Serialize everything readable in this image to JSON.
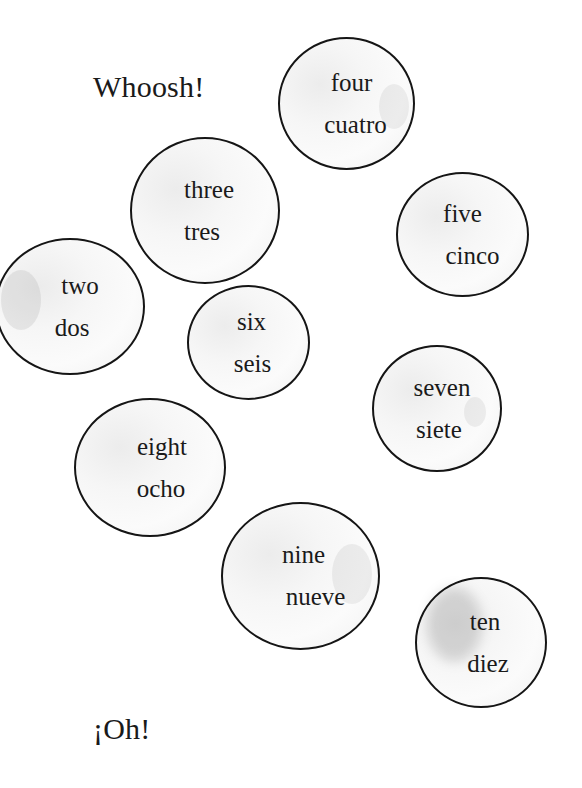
{
  "page": {
    "background": "#ffffff",
    "ink_color": "#151515"
  },
  "captions": {
    "top": "Whoosh!",
    "bottom": "¡Oh!"
  },
  "bubbles": [
    {
      "id": "two",
      "english": "two",
      "spanish": "dos"
    },
    {
      "id": "three",
      "english": "three",
      "spanish": "tres"
    },
    {
      "id": "four",
      "english": "four",
      "spanish": "cuatro"
    },
    {
      "id": "five",
      "english": "five",
      "spanish": "cinco"
    },
    {
      "id": "six",
      "english": "six",
      "spanish": "seis"
    },
    {
      "id": "seven",
      "english": "seven",
      "spanish": "siete"
    },
    {
      "id": "eight",
      "english": "eight",
      "spanish": "ocho"
    },
    {
      "id": "nine",
      "english": "nine",
      "spanish": "nueve"
    },
    {
      "id": "ten",
      "english": "ten",
      "spanish": "diez"
    }
  ]
}
